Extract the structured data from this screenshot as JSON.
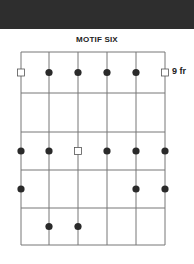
{
  "header": {
    "band_color": "#2e2e2e"
  },
  "title": "MOTIF SIX",
  "fret_label": "9 fr",
  "diagram": {
    "strings": 6,
    "frets": 5,
    "string_x": [
      21,
      49,
      78,
      107,
      136,
      165
    ],
    "fret_y": [
      52,
      93,
      132,
      170,
      208,
      245
    ],
    "markers": [
      {
        "string": 1,
        "fret": 1,
        "type": "square"
      },
      {
        "string": 2,
        "fret": 1,
        "type": "dot"
      },
      {
        "string": 3,
        "fret": 1,
        "type": "dot"
      },
      {
        "string": 4,
        "fret": 1,
        "type": "dot"
      },
      {
        "string": 5,
        "fret": 1,
        "type": "dot"
      },
      {
        "string": 6,
        "fret": 1,
        "type": "square"
      },
      {
        "string": 1,
        "fret": 3,
        "type": "dot"
      },
      {
        "string": 2,
        "fret": 3,
        "type": "dot"
      },
      {
        "string": 3,
        "fret": 3,
        "type": "square"
      },
      {
        "string": 4,
        "fret": 3,
        "type": "dot"
      },
      {
        "string": 5,
        "fret": 3,
        "type": "dot"
      },
      {
        "string": 6,
        "fret": 3,
        "type": "dot"
      },
      {
        "string": 1,
        "fret": 4,
        "type": "dot"
      },
      {
        "string": 5,
        "fret": 4,
        "type": "dot"
      },
      {
        "string": 6,
        "fret": 4,
        "type": "dot"
      },
      {
        "string": 2,
        "fret": 5,
        "type": "dot"
      },
      {
        "string": 3,
        "fret": 5,
        "type": "dot"
      }
    ],
    "line_color": "#777777",
    "dot_color": "#2a2a2a"
  }
}
